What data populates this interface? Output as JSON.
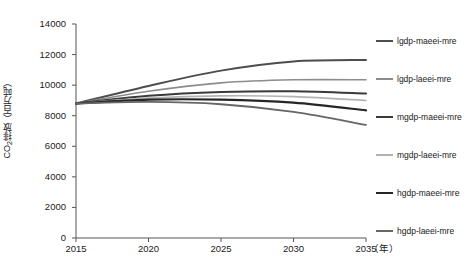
{
  "chart_data": {
    "type": "line",
    "title": "",
    "xlabel": "年",
    "ylabel": "CO₂排放（百万吨）",
    "x": [
      2015,
      2020,
      2025,
      2030,
      2035
    ],
    "xlim": [
      2015,
      2035
    ],
    "ylim": [
      0,
      14000
    ],
    "ytick_values": [
      0,
      2000,
      4000,
      6000,
      8000,
      10000,
      12000,
      14000
    ],
    "ytick_labels": [
      "0",
      "2000",
      "4000",
      "6000",
      "8000",
      "10000",
      "12000",
      "14000"
    ],
    "xtick_labels": [
      "2015",
      "2020",
      "2025",
      "2030",
      "2035"
    ],
    "x_unit_label": "（年）",
    "grid": false,
    "legend_position": "right",
    "series": [
      {
        "name": "lgdp-maeei-mre",
        "color": "#4d4d4d",
        "width": 2.0,
        "values": [
          8800,
          9950,
          10950,
          11550,
          11650
        ]
      },
      {
        "name": "lgdp-laeei-mre",
        "color": "#8c8c8c",
        "width": 1.6,
        "values": [
          8800,
          9600,
          10150,
          10350,
          10350
        ]
      },
      {
        "name": "mgdp-maeei-mre",
        "color": "#3a3a3a",
        "width": 2.0,
        "values": [
          8800,
          9300,
          9550,
          9600,
          9450
        ]
      },
      {
        "name": "mgdp-laeei-mre",
        "color": "#b3b3b3",
        "width": 1.6,
        "values": [
          8800,
          9150,
          9300,
          9250,
          9000
        ]
      },
      {
        "name": "hgdp-maeei-mre",
        "color": "#262626",
        "width": 2.2,
        "values": [
          8800,
          9050,
          9050,
          8850,
          8350
        ]
      },
      {
        "name": "hgdp-laeei-mre",
        "color": "#666666",
        "width": 1.8,
        "values": [
          8800,
          8900,
          8750,
          8250,
          7400
        ]
      }
    ]
  },
  "axes": {
    "y_title": "CO",
    "y_title_sub": "2",
    "y_title_rest": "排放（百万吨）"
  }
}
